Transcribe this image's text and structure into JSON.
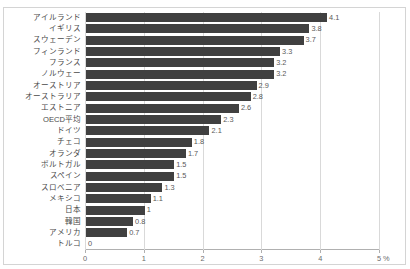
{
  "chart_data": {
    "type": "bar",
    "orientation": "horizontal",
    "title": "",
    "xlabel": "%",
    "ylabel": "",
    "xlim": [
      0,
      5
    ],
    "xticks": [
      "0",
      "1",
      "2",
      "3",
      "4",
      "5"
    ],
    "grid": true,
    "legend": false,
    "bar_color": "#404040",
    "categories": [
      "アイルランド",
      "イギリス",
      "スウェーデン",
      "フィンランド",
      "フランス",
      "ノルウェー",
      "オーストリア",
      "オーストラリア",
      "エストニア",
      "OECD平均",
      "ドイツ",
      "チェコ",
      "オランダ",
      "ポルトガル",
      "スペイン",
      "スロベニア",
      "メキシコ",
      "日本",
      "韓国",
      "アメリカ",
      "トルコ"
    ],
    "values": [
      4.1,
      3.8,
      3.7,
      3.3,
      3.2,
      3.2,
      2.9,
      2.8,
      2.6,
      2.3,
      2.1,
      1.8,
      1.7,
      1.5,
      1.5,
      1.3,
      1.1,
      1,
      0.8,
      0.7,
      0
    ],
    "value_labels": [
      "4.1",
      "3.8",
      "3.7",
      "3.3",
      "3.2",
      "3.2",
      "2.9",
      "2.8",
      "2.6",
      "2.3",
      "2.1",
      "1.8",
      "1.7",
      "1.5",
      "1.5",
      "1.3",
      "1.1",
      "1",
      "0.8",
      "0.7",
      "0"
    ],
    "unit_label": "%"
  }
}
